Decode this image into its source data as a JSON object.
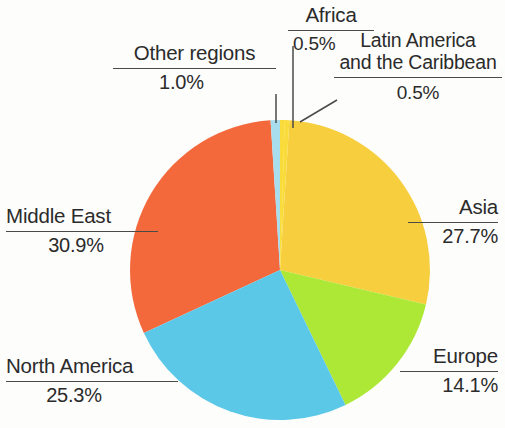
{
  "chart_data": {
    "type": "pie",
    "title": "",
    "subtitle": "",
    "xlabel": "",
    "ylabel": "",
    "legend_position": "callout-labels",
    "grid": false,
    "units": "percent",
    "total": 100.0,
    "start_angle_deg": 0,
    "direction": "clockwise",
    "categories": [
      "Africa",
      "Latin America and the Caribbean",
      "Asia",
      "Europe",
      "North America",
      "Middle East",
      "Other regions"
    ],
    "values": [
      0.5,
      0.5,
      27.7,
      14.1,
      25.3,
      30.9,
      1.0
    ],
    "slices": [
      {
        "name": "Africa",
        "label": "Africa",
        "value": 0.5,
        "value_label": "0.5%",
        "color": "#FFEE33",
        "start_deg": 0.0,
        "end_deg": 1.8
      },
      {
        "name": "Latin America and the Caribbean",
        "label": "Latin America\nand the Caribbean",
        "label_line1": "Latin America",
        "label_line2": "and the Caribbean",
        "value": 0.5,
        "value_label": "0.5%",
        "color": "#F9DC3C",
        "start_deg": 1.8,
        "end_deg": 3.6
      },
      {
        "name": "Asia",
        "label": "Asia",
        "value": 27.7,
        "value_label": "27.7%",
        "color": "#F6CE3E",
        "start_deg": 3.6,
        "end_deg": 103.32
      },
      {
        "name": "Europe",
        "label": "Europe",
        "value": 14.1,
        "value_label": "14.1%",
        "color": "#AEE837",
        "start_deg": 103.32,
        "end_deg": 154.08
      },
      {
        "name": "North America",
        "label": "North America",
        "value": 25.3,
        "value_label": "25.3%",
        "color": "#5BC8E8",
        "start_deg": 154.08,
        "end_deg": 245.16
      },
      {
        "name": "Middle East",
        "label": "Middle East",
        "value": 30.9,
        "value_label": "30.9%",
        "color": "#F4693B",
        "start_deg": 245.16,
        "end_deg": 356.4
      },
      {
        "name": "Other regions",
        "label": "Other regions",
        "value": 1.0,
        "value_label": "1.0%",
        "color": "#A8DDEE",
        "start_deg": 356.4,
        "end_deg": 360.0
      }
    ]
  },
  "callouts": {
    "other_regions": {
      "label": "Other regions",
      "value": "1.0%"
    },
    "africa": {
      "label": "Africa",
      "value": "0.5%"
    },
    "latin_america": {
      "line1": "Latin America",
      "line2": "and the Caribbean",
      "value": "0.5%"
    },
    "asia": {
      "label": "Asia",
      "value": "27.7%"
    },
    "europe": {
      "label": "Europe",
      "value": "14.1%"
    },
    "north_america": {
      "label": "North America",
      "value": "25.3%"
    },
    "middle_east": {
      "label": "Middle East",
      "value": "30.9%"
    }
  },
  "colors": {
    "africa": "#FFEE33",
    "latin_america": "#F9DC3C",
    "asia": "#F6CE3E",
    "europe": "#AEE837",
    "north_america": "#5BC8E8",
    "middle_east": "#F4693B",
    "other_regions": "#A8DDEE",
    "leader_line": "#4a4a48",
    "text": "#2b2b2b",
    "background": "#fdfdfc"
  }
}
